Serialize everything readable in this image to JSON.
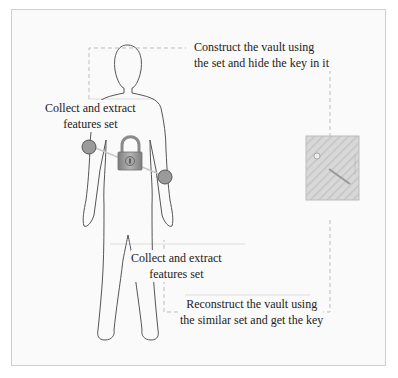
{
  "diagram": {
    "labels": {
      "construct_line1": "Construct the vault using",
      "construct_line2": "the set and hide the key in it",
      "collect_top_line1": "Collect and extract",
      "collect_top_line2": "features set",
      "collect_bottom_line1": "Collect and extract",
      "collect_bottom_line2": "features set",
      "reconstruct_line1": "Reconstruct the vault using",
      "reconstruct_line2": "the similar set and get the key"
    },
    "icons": {
      "padlock": "padlock-icon",
      "vault_key": "vault-key-icon",
      "feature_point": "feature-point-icon",
      "body": "human-body-outline"
    },
    "colors": {
      "feature_point": "#9a9a9a",
      "padlock": "#8f8f8f",
      "vault": "#d4d4d4",
      "dashed_line": "#bdbdbd",
      "outline": "#555555"
    }
  }
}
